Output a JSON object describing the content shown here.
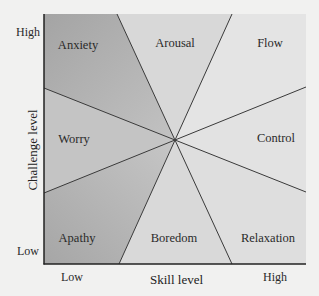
{
  "diagram": {
    "type": "flow-model-eight-channel",
    "x_axis": {
      "title": "Skill level",
      "low_label": "Low",
      "high_label": "High"
    },
    "y_axis": {
      "title": "Challenge level",
      "low_label": "Low",
      "high_label": "High"
    },
    "regions": {
      "anxiety": "Anxiety",
      "arousal": "Arousal",
      "flow": "Flow",
      "worry": "Worry",
      "control": "Control",
      "apathy": "Apathy",
      "boredom": "Boredom",
      "relaxation": "Relaxation"
    },
    "colors": {
      "page_background": "#f1f1f0",
      "dark_region": "#a9a9a9",
      "mid_region": "#cfcfcf",
      "light_region": "#e3e3e3",
      "line": "#3a3a3a"
    }
  }
}
